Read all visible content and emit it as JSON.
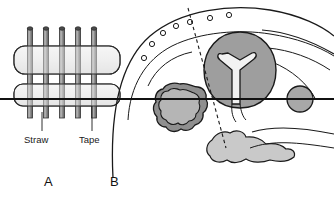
{
  "figure": {
    "width": 334,
    "height": 197,
    "background_color": "#ffffff",
    "stroke_color": "#1a1a1a",
    "panels": [
      {
        "letter": "A",
        "name": "straw-and-tape-grid-model",
        "letter_x": 44,
        "letter_y": 186,
        "labels": [
          {
            "text": "Straw",
            "x": 24,
            "y": 140,
            "leader_from_x": 42,
            "leader_from_y": 131,
            "leader_to_x": 42,
            "leader_to_y": 112
          },
          {
            "text": "Tape",
            "x": 80,
            "y": 140,
            "leader_from_x": 92,
            "leader_from_y": 131,
            "leader_to_x": 92,
            "leader_to_y": 105
          }
        ],
        "straw_count": 5,
        "straw_x_positions": [
          30,
          46,
          62,
          78,
          94
        ],
        "straw_top_y": 28,
        "straw_bottom_y": 118,
        "straw_width": 5,
        "tape_strips": [
          {
            "x": 14,
            "y": 46,
            "width": 106,
            "height": 28,
            "rx": 11
          },
          {
            "x": 14,
            "y": 84,
            "width": 106,
            "height": 22,
            "rx": 9
          }
        ]
      },
      {
        "letter": "B",
        "name": "pelvic-anatomy-cross-section",
        "letter_x": 110,
        "letter_y": 186,
        "structures": [
          {
            "name": "uterus",
            "fill": "#9e9e9e",
            "cx": 240,
            "cy": 72
          },
          {
            "name": "uterine-cavity",
            "fill": "#f2f2f2"
          },
          {
            "name": "polycystic-ovary-mass",
            "fill": "#b5b5b5",
            "cx": 180,
            "cy": 120
          },
          {
            "name": "ovarian-follicle-rim",
            "fill": "#8f8f8f"
          },
          {
            "name": "bowel-rectum",
            "fill": "#c9c9c9"
          },
          {
            "name": "round-cyst",
            "fill": "#a8a8a8",
            "cx": 300,
            "cy": 99,
            "r": 13
          }
        ],
        "follicle_circles": [
          {
            "cx": 144,
            "cy": 58
          },
          {
            "cx": 152,
            "cy": 44
          },
          {
            "cx": 163,
            "cy": 33
          },
          {
            "cx": 176,
            "cy": 26
          },
          {
            "cx": 190,
            "cy": 22
          },
          {
            "cx": 210,
            "cy": 18
          },
          {
            "cx": 229,
            "cy": 15
          }
        ],
        "follicle_radius": 2.6,
        "dashed_plane_line": {
          "x1": 188,
          "y1": 8,
          "x2": 226,
          "y2": 148
        }
      }
    ],
    "horizontal_reference_line": {
      "x1": 0,
      "y1": 99,
      "x2": 334,
      "y2": 99,
      "width": 2.2
    }
  }
}
